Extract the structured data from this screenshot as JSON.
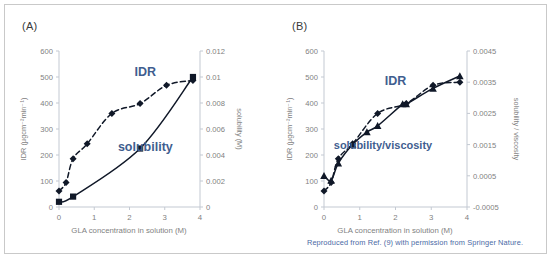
{
  "figure": {
    "caption": "Reproduced from Ref. (9) with permission from Springer Nature.",
    "caption_color": "#4a6aa5",
    "annotation_color": "#3f5e8f",
    "axis_text_color": "#7f7f7f",
    "curve_color": "#101828",
    "border_color": "#c9c9c9",
    "background": "#ffffff"
  },
  "panels": [
    {
      "id": "A",
      "label": "(A)"
    },
    {
      "id": "B",
      "label": "(B)"
    }
  ],
  "chart_data": [
    {
      "type": "line",
      "panel": "(A)",
      "title": "",
      "xlabel": "GLA concentration in solution (M)",
      "ylabel": "IDR (μgcm⁻²min⁻¹)",
      "y2label": "solubility (M)",
      "xlim": [
        0,
        4
      ],
      "ylim": [
        0,
        600
      ],
      "y2lim": [
        0,
        0.012
      ],
      "xticks": [
        "0",
        "1",
        "2",
        "3",
        "4"
      ],
      "xtick_values": [
        0,
        1,
        2,
        3,
        4
      ],
      "yticks": [
        "0",
        "100",
        "200",
        "300",
        "400",
        "500",
        "600"
      ],
      "ytick_values": [
        0,
        100,
        200,
        300,
        400,
        500,
        600
      ],
      "y2ticks": [
        "0",
        "0.002",
        "0.004",
        "0.006",
        "0.008",
        "0.01",
        "0.012"
      ],
      "y2tick_values": [
        0,
        0.002,
        0.004,
        0.006,
        0.008,
        0.01,
        0.012
      ],
      "grid": false,
      "legend_position": "inline-annotations",
      "series": [
        {
          "name": "IDR",
          "axis": "left",
          "marker": "diamond",
          "linestyle": "dashed",
          "annotation": "IDR",
          "annotation_x": 2.45,
          "annotation_y": 505,
          "x": [
            0.0,
            0.2,
            0.4,
            0.8,
            1.5,
            2.3,
            3.05,
            3.8
          ],
          "y": [
            62,
            94,
            186,
            243,
            360,
            398,
            468,
            487
          ]
        },
        {
          "name": "solubility",
          "axis": "right",
          "marker": "square",
          "linestyle": "solid",
          "annotation": "solubility",
          "annotation_x": 2.45,
          "annotation_y": 215,
          "x": [
            0.0,
            0.4,
            2.3,
            3.8
          ],
          "y": [
            0.0004,
            0.0008,
            0.0045,
            0.01
          ]
        }
      ]
    },
    {
      "type": "line",
      "panel": "(B)",
      "title": "",
      "xlabel": "GLA concentration in solution (M)",
      "ylabel": "IDR (μgcm⁻²min⁻¹)",
      "y2label": "solubility / viscosity",
      "xlim": [
        0,
        4
      ],
      "ylim": [
        0,
        600
      ],
      "y2lim": [
        -0.0005,
        0.0045
      ],
      "xticks": [
        "0",
        "1",
        "2",
        "3",
        "4"
      ],
      "xtick_values": [
        0,
        1,
        2,
        3,
        4
      ],
      "yticks": [
        "0",
        "100",
        "200",
        "300",
        "400",
        "500",
        "600"
      ],
      "ytick_values": [
        0,
        100,
        200,
        300,
        400,
        500,
        600
      ],
      "y2ticks": [
        "-0.0005",
        "0.0005",
        "0.0015",
        "0.0025",
        "0.0035",
        "0.0045"
      ],
      "y2tick_values": [
        -0.0005,
        0.0005,
        0.0015,
        0.0025,
        0.0035,
        0.0045
      ],
      "grid": false,
      "legend_position": "inline-annotations",
      "series": [
        {
          "name": "IDR",
          "axis": "left",
          "marker": "diamond",
          "linestyle": "dashed",
          "annotation": "IDR",
          "annotation_x": 2.0,
          "annotation_y": 470,
          "x": [
            0.0,
            0.2,
            0.4,
            0.8,
            1.5,
            2.3,
            3.05,
            3.8
          ],
          "y": [
            62,
            94,
            186,
            243,
            360,
            398,
            468,
            480
          ]
        },
        {
          "name": "solubility/viscosity",
          "axis": "right",
          "marker": "triangle",
          "linestyle": "solid",
          "annotation": "solubility/viscosity",
          "annotation_x": 1.65,
          "annotation_y": 222,
          "x": [
            0.0,
            0.2,
            0.4,
            0.8,
            1.2,
            1.5,
            2.2,
            2.3,
            3.05,
            3.8
          ],
          "y": [
            0.0005,
            0.00035,
            0.0009,
            0.0015,
            0.0019,
            0.0021,
            0.0028,
            0.0028,
            0.0033,
            0.0037
          ]
        }
      ]
    }
  ]
}
